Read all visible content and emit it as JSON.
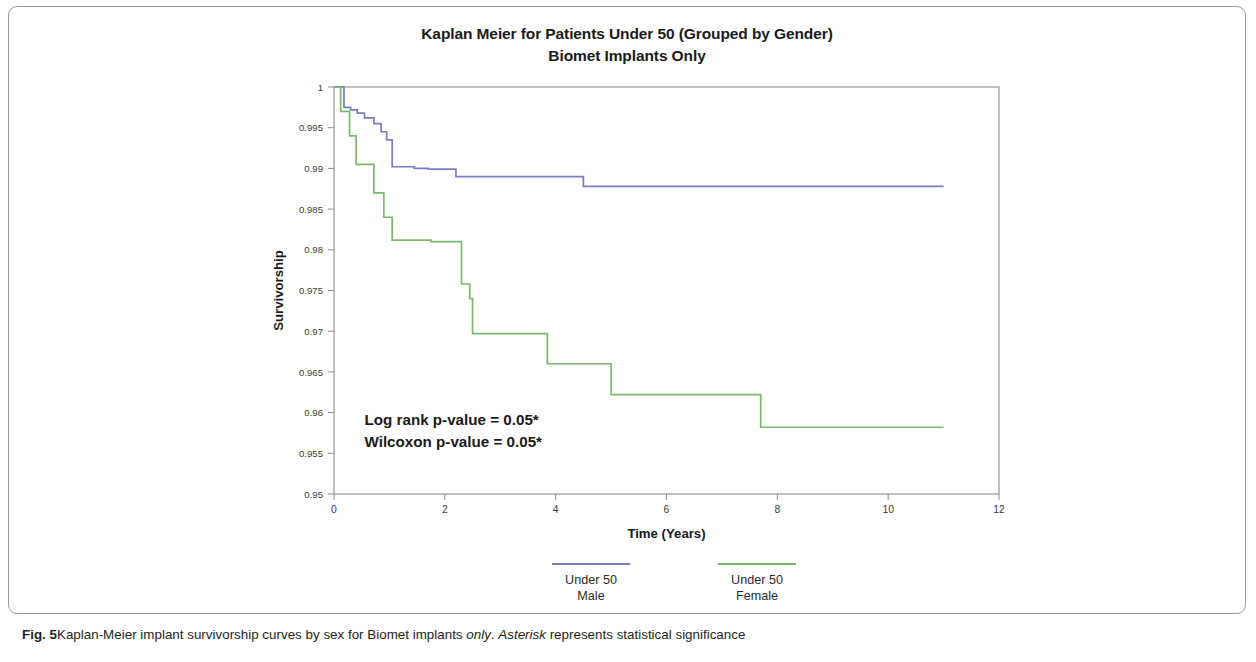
{
  "figure": {
    "caption_label": "Fig. 5",
    "caption_part1": "Kaplan-Meier implant survivorship curves by sex for Biomet implants ",
    "caption_italic1": "only",
    "caption_part2": ". ",
    "caption_italic2": "Asterisk",
    "caption_part3": " represents statistical significance"
  },
  "chart_data": {
    "type": "line",
    "subtype": "kaplan-meier-step",
    "title": "Kaplan Meier for Patients Under 50 (Grouped by Gender)",
    "subtitle": "Biomet Implants Only",
    "xlabel": "Time (Years)",
    "ylabel": "Survivorship",
    "xlim": [
      0,
      12
    ],
    "ylim": [
      0.95,
      1
    ],
    "xticks": [
      0,
      2,
      4,
      6,
      8,
      10,
      12
    ],
    "xtick_labels": [
      "0",
      "2",
      "4",
      "6",
      "8",
      "10",
      "12"
    ],
    "yticks": [
      0.95,
      0.955,
      0.96,
      0.965,
      0.97,
      0.975,
      0.98,
      0.985,
      0.99,
      0.995,
      1
    ],
    "ytick_labels": [
      "0.95",
      "0.955",
      "0.96",
      "0.965",
      "0.97",
      "0.975",
      "0.98",
      "0.985",
      "0.99",
      "0.995",
      "1"
    ],
    "grid": false,
    "legend_position": "bottom",
    "series": [
      {
        "name": "Under 50\nMale",
        "legend_line1": "Under 50",
        "legend_line2": "Male",
        "color": "#7b7cc2",
        "x": [
          0.0,
          0.18,
          0.3,
          0.42,
          0.55,
          0.72,
          0.85,
          0.95,
          1.05,
          1.45,
          1.7,
          2.2,
          4.5,
          11.0
        ],
        "y": [
          1.0,
          0.9975,
          0.9972,
          0.9968,
          0.9962,
          0.9955,
          0.9945,
          0.9935,
          0.9902,
          0.99,
          0.9899,
          0.989,
          0.9878,
          0.9878
        ]
      },
      {
        "name": "Under 50\nFemale",
        "legend_line1": "Under 50",
        "legend_line2": "Female",
        "color": "#7cb96e",
        "x": [
          0.0,
          0.12,
          0.28,
          0.4,
          0.72,
          0.9,
          1.05,
          1.75,
          2.3,
          2.45,
          2.5,
          3.85,
          5.0,
          7.7,
          11.0
        ],
        "y": [
          1.0,
          0.997,
          0.994,
          0.9905,
          0.987,
          0.984,
          0.9812,
          0.981,
          0.9758,
          0.974,
          0.9697,
          0.966,
          0.9622,
          0.9582,
          0.9582
        ]
      }
    ],
    "annotations": [
      {
        "text": "Log rank p-value = 0.05*",
        "x": 0.55,
        "y": 0.9585
      },
      {
        "text": "Wilcoxon p-value = 0.05*",
        "x": 0.55,
        "y": 0.9558
      }
    ]
  }
}
